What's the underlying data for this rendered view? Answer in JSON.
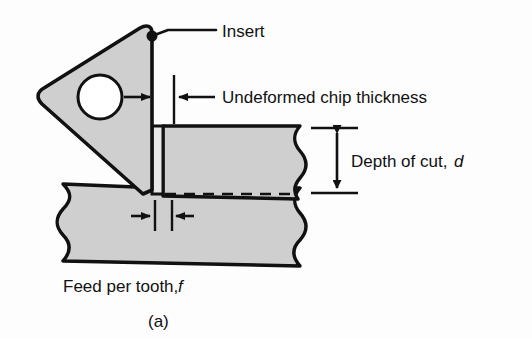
{
  "figure": {
    "caption": "(a)",
    "background_color": "#fdfdfd",
    "line_color": "#111111",
    "fill_color": "#cfcfcf",
    "labels": {
      "insert": "Insert",
      "undeformed_chip_thickness": "Undeformed chip thickness",
      "depth_of_cut_text": "Depth of cut,",
      "depth_of_cut_symbol": "d",
      "feed_per_tooth_text": "Feed per tooth,",
      "feed_per_tooth_symbol": "f"
    },
    "ghost_bleedthrough": "",
    "parts": {
      "insert_name": "triangular cutting insert",
      "insert_hole": "clamp hole",
      "workpiece_name": "workpiece",
      "chip_name": "undeformed chip"
    }
  }
}
